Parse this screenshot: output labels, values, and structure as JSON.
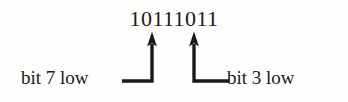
{
  "figure": {
    "background_color": "#fdfdfc",
    "ink_color": "#191919",
    "binary_value": "10111011",
    "annotations": [
      {
        "id": "bit7",
        "label": "bit 7 low",
        "side": "left",
        "target_digit_index": 3,
        "target_digit": "1",
        "arrow_direction": "up"
      },
      {
        "id": "bit3",
        "label": "bit 3 low",
        "side": "right",
        "target_digit_index": 5,
        "target_digit": "0",
        "arrow_direction": "up"
      }
    ]
  },
  "geometry": {
    "left_arrow_x": 152,
    "right_arrow_x": 194,
    "arrow_tip_y": 32,
    "leader_corner_y": 81,
    "left_leader_start_x": 122,
    "right_leader_end_x": 229,
    "stroke_width": 3.2,
    "arrowhead_width": 9,
    "arrowhead_height": 12
  }
}
